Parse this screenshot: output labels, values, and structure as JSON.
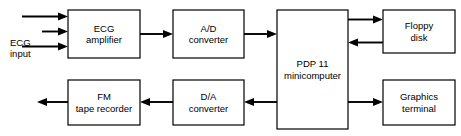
{
  "diagram": {
    "canvas": {
      "width": 461,
      "height": 136
    },
    "stroke_color": "#000000",
    "fill_color": "#ffffff",
    "blocks": [
      {
        "id": "ecg-amplifier",
        "label": "ECG\namplifier",
        "line1": "ECG",
        "line2": "amplifier",
        "x": 68,
        "y": 10,
        "w": 72,
        "h": 48
      },
      {
        "id": "ad-converter",
        "label": "A/D\nconverter",
        "line1": "A/D",
        "line2": "converter",
        "x": 173,
        "y": 10,
        "w": 71,
        "h": 48
      },
      {
        "id": "pdp-11-minicomputer",
        "label": "PDP 11\nminicomputer",
        "line1": "PDP 11",
        "line2": "minicomputer",
        "x": 277,
        "y": 10,
        "w": 71,
        "h": 119
      },
      {
        "id": "floppy-disk",
        "label": "Floppy\ndisk",
        "line1": "Floppy",
        "line2": "disk",
        "x": 383,
        "y": 10,
        "w": 72,
        "h": 43
      },
      {
        "id": "graphics-terminal",
        "label": "Graphics\nterminal",
        "line1": "Graphics",
        "line2": "terminal",
        "x": 383,
        "y": 80,
        "w": 72,
        "h": 45
      },
      {
        "id": "da-converter",
        "label": "D/A\nconverter",
        "line1": "D/A",
        "line2": "converter",
        "x": 173,
        "y": 80,
        "w": 71,
        "h": 45
      },
      {
        "id": "fm-tape-recorder",
        "label": "FM\ntape recorder",
        "line1": "FM",
        "line2": "tape recorder",
        "x": 68,
        "y": 80,
        "w": 72,
        "h": 45
      }
    ],
    "labels": [
      {
        "id": "ecg-input",
        "text": "ECG\ninput",
        "line1": "ECG",
        "line2": "input",
        "x": 10,
        "y": 24
      }
    ],
    "connections": [
      {
        "id": "ecg-input-lead-1",
        "from": "ecg-input",
        "to": "ecg-amplifier",
        "direction": "right"
      },
      {
        "id": "ecg-input-lead-2",
        "from": "ecg-input",
        "to": "ecg-amplifier",
        "direction": "right"
      },
      {
        "id": "ecg-input-lead-3",
        "from": "ecg-input",
        "to": "ecg-amplifier",
        "direction": "right"
      },
      {
        "id": "amplifier-to-ad",
        "from": "ecg-amplifier",
        "to": "ad-converter",
        "direction": "right"
      },
      {
        "id": "ad-to-pdp",
        "from": "ad-converter",
        "to": "pdp-11-minicomputer",
        "direction": "right"
      },
      {
        "id": "pdp-to-floppy",
        "from": "pdp-11-minicomputer",
        "to": "floppy-disk",
        "direction": "right"
      },
      {
        "id": "floppy-to-pdp",
        "from": "floppy-disk",
        "to": "pdp-11-minicomputer",
        "direction": "left"
      },
      {
        "id": "pdp-to-graphics",
        "from": "pdp-11-minicomputer",
        "to": "graphics-terminal",
        "direction": "right"
      },
      {
        "id": "pdp-to-da",
        "from": "pdp-11-minicomputer",
        "to": "da-converter",
        "direction": "left"
      },
      {
        "id": "da-to-tape",
        "from": "da-converter",
        "to": "fm-tape-recorder",
        "direction": "left"
      },
      {
        "id": "tape-output",
        "from": "fm-tape-recorder",
        "to": "output",
        "direction": "left"
      }
    ]
  }
}
